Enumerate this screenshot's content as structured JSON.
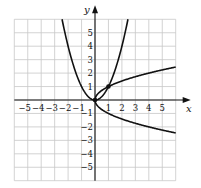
{
  "chart_data": {
    "type": "line",
    "title": "",
    "xlabel": "x",
    "ylabel": "y",
    "xlim": [
      -6,
      6
    ],
    "ylim": [
      -6,
      6
    ],
    "grid": true,
    "legend": "none",
    "x_ticks": [
      -5,
      -4,
      -3,
      -2,
      -1,
      1,
      2,
      3,
      4,
      5
    ],
    "y_ticks": [
      -5,
      -4,
      -3,
      -2,
      -1,
      1,
      2,
      3,
      4,
      5
    ],
    "x_tick_labels": [
      "−5",
      "−4",
      "−3",
      "−2",
      "−1",
      "1",
      "2",
      "3",
      "4",
      "5"
    ],
    "y_tick_labels": [
      "−5",
      "−4",
      "−3",
      "−2",
      "−1",
      "1",
      "2",
      "3",
      "4",
      "5"
    ],
    "series": [
      {
        "name": "y = x^2",
        "kind": "parabola_up",
        "x": [
          -2.5,
          -2,
          -1.5,
          -1,
          -0.5,
          0,
          0.5,
          1,
          1.5,
          2,
          2.5
        ],
        "y": [
          6.25,
          4,
          2.25,
          1,
          0.25,
          0,
          0.25,
          1,
          2.25,
          4,
          6.25
        ]
      },
      {
        "name": "x = y^2 (upper branch)",
        "kind": "sqrt_upper",
        "x": [
          0,
          0.25,
          1,
          2,
          3,
          4,
          5,
          6
        ],
        "y": [
          0,
          0.5,
          1,
          1.41,
          1.73,
          2,
          2.24,
          2.45
        ]
      },
      {
        "name": "x = y^2 (lower branch)",
        "kind": "sqrt_lower",
        "x": [
          0,
          0.25,
          1,
          2,
          3,
          4,
          5,
          6
        ],
        "y": [
          0,
          -0.5,
          -1,
          -1.41,
          -1.73,
          -2,
          -2.24,
          -2.45
        ]
      }
    ],
    "points": [
      {
        "label": "intersection",
        "x": 0,
        "y": 0
      },
      {
        "label": "intersection",
        "x": 1,
        "y": 1
      }
    ],
    "color": "#111111",
    "grid_color": "#c8c8c8"
  }
}
